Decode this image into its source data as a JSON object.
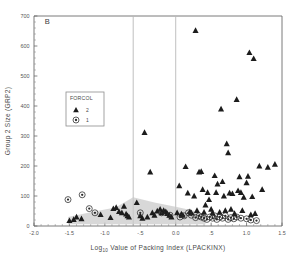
{
  "panel": {
    "label": "B"
  },
  "axes": {
    "y_title": "Group 2 Size (GRP2)",
    "x_title_main": "Log",
    "x_title_sub": "10",
    "x_title_rest": "Value of Packing Index (LPACKINX)",
    "y_ticks": [
      "0",
      "100",
      "200",
      "300",
      "400",
      "500",
      "600",
      "700"
    ],
    "x_ticks": [
      "-2.0",
      "-1.5",
      "-1.0",
      "-.5",
      "0.0",
      ".5",
      "1.0",
      "1.5"
    ]
  },
  "legend": {
    "title": "FORCOL",
    "items": [
      {
        "label": "2",
        "marker": "triangle-icon"
      },
      {
        "label": "1",
        "marker": "circled-dot-icon"
      }
    ]
  },
  "reference_lines": [
    -0.6,
    0.0
  ],
  "chart_data": {
    "type": "scatter",
    "title": "B",
    "xlabel": "Log10 Value of Packing Index (LPACKINX)",
    "ylabel": "Group 2 Size (GRP2)",
    "xlim": [
      -2.0,
      1.5
    ],
    "ylim": [
      0,
      700
    ],
    "grid": false,
    "legend_position": "upper-left-inset",
    "legend_title": "FORCOL",
    "annotations": [
      {
        "text": "B",
        "x": -1.85,
        "y": 672
      }
    ],
    "reference_lines_x": [
      -0.6,
      0.0
    ],
    "shaded_region": {
      "label": "envelope-band",
      "color": "#c9c9c9",
      "points": [
        [
          -1.52,
          10
        ],
        [
          -1.52,
          30
        ],
        [
          -1.15,
          48
        ],
        [
          -0.85,
          62
        ],
        [
          -0.6,
          96
        ],
        [
          -0.3,
          78
        ],
        [
          0.05,
          62
        ],
        [
          0.3,
          48
        ],
        [
          0.42,
          30
        ],
        [
          0.42,
          6
        ],
        [
          -1.52,
          6
        ]
      ]
    },
    "series": [
      {
        "name": "2",
        "marker": "triangle",
        "color": "#1c1c1c",
        "points": [
          [
            -1.5,
            18
          ],
          [
            -1.44,
            22
          ],
          [
            -1.4,
            30
          ],
          [
            -1.33,
            24
          ],
          [
            -1.06,
            38
          ],
          [
            -0.92,
            28
          ],
          [
            -0.88,
            58
          ],
          [
            -0.84,
            62
          ],
          [
            -0.8,
            48
          ],
          [
            -0.76,
            44
          ],
          [
            -0.73,
            66
          ],
          [
            -0.7,
            40
          ],
          [
            -0.68,
            34
          ],
          [
            -0.66,
            30
          ],
          [
            -0.55,
            78
          ],
          [
            -0.5,
            34
          ],
          [
            -0.47,
            26
          ],
          [
            -0.44,
            312
          ],
          [
            -0.4,
            30
          ],
          [
            -0.36,
            180
          ],
          [
            -0.33,
            44
          ],
          [
            -0.3,
            36
          ],
          [
            -0.26,
            50
          ],
          [
            -0.22,
            56
          ],
          [
            -0.2,
            44
          ],
          [
            -0.17,
            52
          ],
          [
            -0.14,
            48
          ],
          [
            -0.12,
            42
          ],
          [
            -0.09,
            36
          ],
          [
            -0.06,
            30
          ],
          [
            0.02,
            44
          ],
          [
            0.05,
            134
          ],
          [
            0.08,
            40
          ],
          [
            0.1,
            36
          ],
          [
            0.14,
            198
          ],
          [
            0.17,
            110
          ],
          [
            0.2,
            48
          ],
          [
            0.22,
            44
          ],
          [
            0.26,
            100
          ],
          [
            0.28,
            652
          ],
          [
            0.3,
            52
          ],
          [
            0.33,
            180
          ],
          [
            0.36,
            182
          ],
          [
            0.38,
            122
          ],
          [
            0.4,
            46
          ],
          [
            0.42,
            70
          ],
          [
            0.45,
            112
          ],
          [
            0.47,
            88
          ],
          [
            0.5,
            56
          ],
          [
            0.52,
            44
          ],
          [
            0.55,
            168
          ],
          [
            0.57,
            112
          ],
          [
            0.59,
            140
          ],
          [
            0.62,
            46
          ],
          [
            0.64,
            390
          ],
          [
            0.66,
            148
          ],
          [
            0.68,
            100
          ],
          [
            0.7,
            52
          ],
          [
            0.72,
            274
          ],
          [
            0.74,
            244
          ],
          [
            0.76,
            110
          ],
          [
            0.78,
            56
          ],
          [
            0.8,
            108
          ],
          [
            0.83,
            42
          ],
          [
            0.86,
            422
          ],
          [
            0.88,
            118
          ],
          [
            0.9,
            164
          ],
          [
            0.92,
            112
          ],
          [
            0.94,
            52
          ],
          [
            0.96,
            96
          ],
          [
            1.0,
            144
          ],
          [
            1.02,
            166
          ],
          [
            1.04,
            578
          ],
          [
            1.06,
            38
          ],
          [
            1.08,
            98
          ],
          [
            1.1,
            558
          ],
          [
            1.12,
            42
          ],
          [
            1.18,
            200
          ],
          [
            1.22,
            122
          ],
          [
            1.3,
            196
          ],
          [
            1.4,
            206
          ]
        ]
      },
      {
        "name": "1",
        "marker": "circled-dot",
        "color": "#2a2a2a",
        "points": [
          [
            -1.52,
            88
          ],
          [
            -1.32,
            104
          ],
          [
            -1.22,
            58
          ],
          [
            -1.14,
            44
          ],
          [
            -0.5,
            44
          ],
          [
            -0.2,
            44
          ],
          [
            -0.08,
            36
          ],
          [
            0.06,
            30
          ],
          [
            0.12,
            34
          ],
          [
            0.18,
            44
          ],
          [
            0.22,
            36
          ],
          [
            0.28,
            28
          ],
          [
            0.33,
            34
          ],
          [
            0.36,
            30
          ],
          [
            0.4,
            26
          ],
          [
            0.44,
            22
          ],
          [
            0.48,
            30
          ],
          [
            0.52,
            26
          ],
          [
            0.55,
            34
          ],
          [
            0.58,
            22
          ],
          [
            0.62,
            30
          ],
          [
            0.66,
            26
          ],
          [
            0.7,
            34
          ],
          [
            0.74,
            22
          ],
          [
            0.78,
            28
          ],
          [
            0.82,
            24
          ],
          [
            0.86,
            30
          ],
          [
            0.92,
            26
          ],
          [
            1.0,
            24
          ],
          [
            1.06,
            20
          ],
          [
            1.14,
            18
          ]
        ]
      }
    ]
  }
}
